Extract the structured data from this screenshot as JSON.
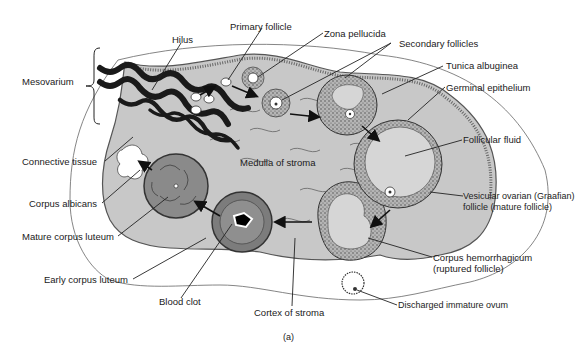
{
  "figure": {
    "caption": "(a)",
    "colors": {
      "stroma": "#c8c8c8",
      "stroma_outline": "#555555",
      "vessels": "#1a1a1a",
      "corpus_luteum": "#8a8a8a",
      "follicular_fluid": "#d6d6d6",
      "label_text": "#1a1a1a"
    }
  },
  "labels": {
    "hilus": "Hilus",
    "mesovarium": "Mesovarium",
    "primary_follicle": "Primary follicle",
    "zona_pellucida": "Zona pellucida",
    "secondary_follicles": "Secondary follicles",
    "tunica_albuginea": "Tunica albuginea",
    "germinal_epithelium": "Germinal epithelium",
    "follicular_fluid": "Follicular fluid",
    "vesicular_line1": "Vesicular ovarian (Graafian)",
    "vesicular_line2": "follicle (mature follicle)",
    "connective_tissue": "Connective tissue",
    "medulla": "Medulla of stroma",
    "corpus_albicans": "Corpus albicans",
    "mature_corpus_luteum": "Mature corpus luteum",
    "early_corpus_luteum": "Early corpus luteum",
    "blood_clot": "Blood clot",
    "cortex": "Cortex of stroma",
    "corpus_hem_line1": "Corpus hemorrhagicum",
    "corpus_hem_line2": "(ruptured follicle)",
    "discharged_ovum": "Discharged immature ovum"
  }
}
